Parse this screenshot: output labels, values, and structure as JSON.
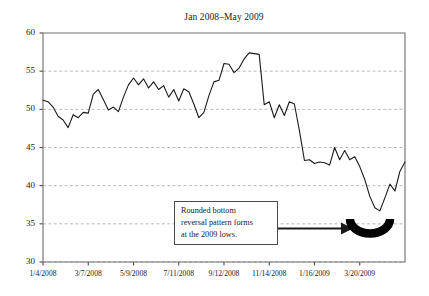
{
  "chart_data": {
    "type": "line",
    "title": "Jan 2008–May 2009",
    "xlabel": "",
    "ylabel": "",
    "ylim": [
      30,
      60
    ],
    "yticks": [
      30,
      35,
      40,
      45,
      50,
      55,
      60
    ],
    "ytick_labels": [
      "30",
      "35",
      "40",
      "45",
      "50",
      "55",
      "60"
    ],
    "grid": "horizontal-dashed",
    "legend": "none",
    "xtick_labels": [
      "1/4/2008",
      "3/7/2008",
      "5/9/2008",
      "7/11/2008",
      "9/12/2008",
      "11/14/2008",
      "1/16/2009",
      "3/20/2009"
    ],
    "xtick_positions": [
      0,
      9,
      18,
      27,
      36,
      45,
      54,
      63
    ],
    "x_index_range": [
      0,
      72
    ],
    "series": [
      {
        "name": "Price",
        "values": [
          51.2,
          51.0,
          50.3,
          49.1,
          48.6,
          47.6,
          49.3,
          48.9,
          49.6,
          49.5,
          52.0,
          52.6,
          51.3,
          49.9,
          50.3,
          49.7,
          51.6,
          53.2,
          54.1,
          53.2,
          54.0,
          52.8,
          53.6,
          52.6,
          53.1,
          51.6,
          52.6,
          51.1,
          52.7,
          52.3,
          50.7,
          48.9,
          49.6,
          51.8,
          53.6,
          53.8,
          56.0,
          55.9,
          54.8,
          55.4,
          56.6,
          57.4,
          57.3,
          57.2,
          50.6,
          51.0,
          48.9,
          50.6,
          49.2,
          51.0,
          50.7,
          47.2,
          43.3,
          43.4,
          42.9,
          43.1,
          43.0,
          42.7,
          45.0,
          43.4,
          44.6,
          43.4,
          43.8,
          42.5,
          40.8,
          38.6,
          37.1,
          36.7,
          38.4,
          40.2,
          39.3,
          41.9,
          43.1
        ]
      }
    ],
    "annotation": {
      "lines": [
        "Rounded bottom",
        "reversal pattern forms",
        "at the 2009 lows."
      ],
      "arrow": "right",
      "marker": "rounded-bottom-arc"
    }
  }
}
